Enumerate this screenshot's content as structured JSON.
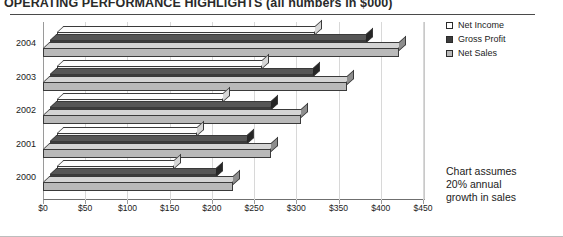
{
  "header": {
    "title": "OPERATING PERFORMANCE HIGHLIGHTS",
    "subtitle": "(all numbers in $000)"
  },
  "legend": {
    "position": "right-top",
    "items": [
      {
        "label": "Net Income",
        "color": "#ffffff",
        "swatch": "net-income"
      },
      {
        "label": "Gross Profit",
        "color": "#3c3c3c",
        "swatch": "gross-profit"
      },
      {
        "label": "Net Sales",
        "color": "#b9b9b9",
        "swatch": "net-sales"
      }
    ]
  },
  "annotation": {
    "line1": "Chart assumes",
    "line2": "20% annual",
    "line3": "growth in sales"
  },
  "axis": {
    "x_ticks": [
      "$0",
      "$50",
      "$100",
      "$150",
      "$200",
      "$250",
      "$300",
      "$350",
      "$400",
      "$450"
    ],
    "y_ticks": [
      "2004",
      "2003",
      "2002",
      "2001",
      "2000"
    ]
  },
  "chart_data": {
    "type": "bar",
    "orientation": "horizontal",
    "title": "OPERATING PERFORMANCE HIGHLIGHTS (all numbers in $000)",
    "xlabel": "",
    "ylabel": "",
    "xlim": [
      0,
      450
    ],
    "grid": true,
    "legend_position": "right",
    "categories": [
      "2000",
      "2001",
      "2002",
      "2003",
      "2004"
    ],
    "category_order_top_to_bottom": [
      "2004",
      "2003",
      "2002",
      "2001",
      "2000"
    ],
    "series": [
      {
        "name": "Net Sales",
        "color": "#b9b9b9",
        "values": [
          225,
          270,
          305,
          360,
          421
        ]
      },
      {
        "name": "Gross Profit",
        "color": "#3c3c3c",
        "values": [
          196,
          233,
          262,
          311,
          374
        ]
      },
      {
        "name": "Net Income",
        "color": "#ffffff",
        "values": [
          139,
          166,
          196,
          243,
          305
        ]
      }
    ],
    "annotations": [
      "Chart assumes 20% annual growth in sales"
    ],
    "units": "$000"
  }
}
